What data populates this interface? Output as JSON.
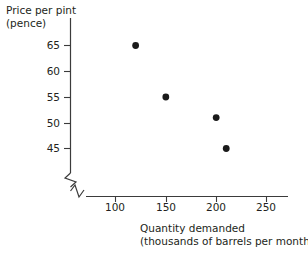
{
  "chart_data": {
    "type": "scatter",
    "title": "",
    "xlabel": "Quantity demanded",
    "xlabel_line2": "(thousands of barrels per month)",
    "ylabel": "Price per pint",
    "ylabel_line2": "(pence)",
    "xticks": [
      100,
      150,
      200,
      250
    ],
    "xtick_labels": [
      "100",
      "150",
      "200",
      "250"
    ],
    "yticks": [
      45,
      50,
      55,
      60,
      65
    ],
    "ytick_labels": [
      "45",
      "50",
      "55",
      "60",
      "65"
    ],
    "xlim": [
      75,
      275
    ],
    "ylim": [
      42,
      68
    ],
    "axis_break_x": true,
    "axis_break_y": true,
    "grid": false,
    "legend": null,
    "marker": "filled-circle",
    "marker_color": "#1a1a1a",
    "axis_color": "#3b3b3b",
    "background_color": "#ffffff",
    "points": [
      {
        "x": 120,
        "y": 65
      },
      {
        "x": 150,
        "y": 55
      },
      {
        "x": 200,
        "y": 51
      },
      {
        "x": 210,
        "y": 45
      }
    ]
  }
}
